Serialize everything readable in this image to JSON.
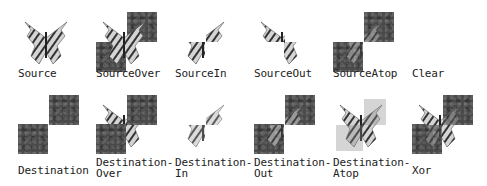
{
  "colors": {
    "square": "#4a4a4a",
    "butterfly_light": "#d8d8d8",
    "butterfly_dark": "#333333",
    "text": "#222222"
  },
  "modes": [
    {
      "id": "source",
      "line1": "Source",
      "line2": "",
      "squares": false,
      "butterfly": "full"
    },
    {
      "id": "source-over",
      "line1": "SourceOver",
      "line2": "",
      "squares": true,
      "butterfly": "full-over"
    },
    {
      "id": "source-in",
      "line1": "SourceIn",
      "line2": "",
      "squares": false,
      "butterfly": "in"
    },
    {
      "id": "source-out",
      "line1": "SourceOut",
      "line2": "",
      "squares": false,
      "butterfly": "out"
    },
    {
      "id": "source-atop",
      "line1": "SourceAtop",
      "line2": "",
      "squares": true,
      "butterfly": "atop"
    },
    {
      "id": "clear",
      "line1": "Clear",
      "line2": "",
      "squares": false,
      "butterfly": "none"
    },
    {
      "id": "destination",
      "line1": "Destination",
      "line2": "",
      "squares": true,
      "butterfly": "none"
    },
    {
      "id": "destination-over",
      "line1": "Destination-",
      "line2": "Over",
      "squares": true,
      "butterfly": "under"
    },
    {
      "id": "destination-in",
      "line1": "Destination-",
      "line2": "In",
      "squares": false,
      "butterfly": "dest-in"
    },
    {
      "id": "destination-out",
      "line1": "Destination-",
      "line2": "Out",
      "squares": true,
      "butterfly": "dest-out"
    },
    {
      "id": "destination-atop",
      "line1": "Destination-",
      "line2": "Atop",
      "squares": false,
      "butterfly": "dest-atop"
    },
    {
      "id": "xor",
      "line1": "Xor",
      "line2": "",
      "squares": true,
      "butterfly": "xor"
    }
  ]
}
